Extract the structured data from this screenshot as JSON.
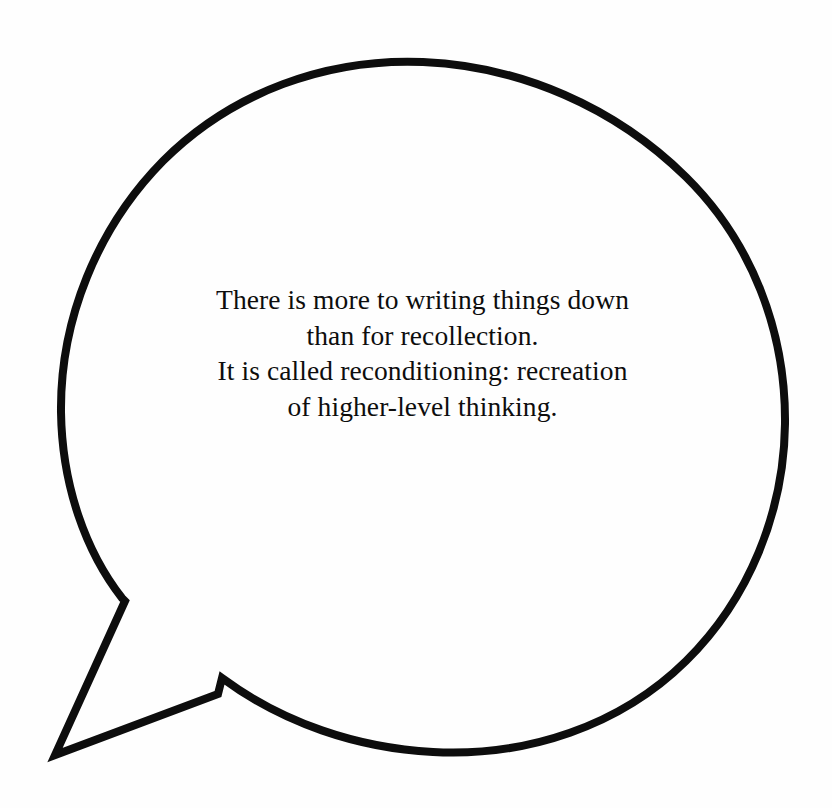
{
  "figure": {
    "kind": "speech-bubble-illustration",
    "background_color": "#fefefe",
    "stroke_color": "#0d0d0d",
    "text_color": "#0d0d0d",
    "stroke_width": 8
  },
  "bubble": {
    "shape": "ellipse-with-tail",
    "center_x": 422,
    "center_y": 407,
    "radius_x": 362,
    "radius_y": 345,
    "tail": {
      "upper_attach": [
        122,
        598
      ],
      "notch": [
        125,
        601
      ],
      "tip": [
        55,
        755
      ],
      "lower_attach": [
        218,
        694
      ]
    }
  },
  "quote": {
    "lines": [
      "There is more to writing things down",
      "than for recollection.",
      "It is called reconditioning: recreation",
      "of higher-level thinking."
    ],
    "line_1": "There is more to writing things down",
    "line_2": "than for recollection.",
    "line_3": "It is called reconditioning: recreation",
    "line_4": "of higher-level thinking.",
    "alignment": "center",
    "font_size_px": 27
  }
}
